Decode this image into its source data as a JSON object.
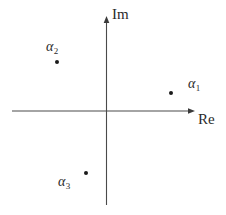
{
  "figure": {
    "type": "complex-plane-diagram",
    "background_color": "#ffffff",
    "line_color": "#4a4a4a",
    "text_color": "#2b2b2b",
    "dot_color": "#1a1a1a",
    "width": 226,
    "height": 215
  },
  "axes": {
    "real": {
      "label": "Re",
      "label_x": 198,
      "label_y": 112,
      "start_x": 12,
      "end_x": 195,
      "y": 111,
      "arrow": "right"
    },
    "imaginary": {
      "label": "Im",
      "label_x": 112,
      "label_y": 7,
      "x": 106,
      "start_y": 205,
      "end_y": 16,
      "arrow": "up"
    },
    "origin": {
      "x": 106,
      "y": 111
    }
  },
  "points": [
    {
      "name": "alpha-1",
      "symbol": "α",
      "subscript": "1",
      "dot_x": 171,
      "dot_y": 93,
      "label_x": 188,
      "label_y": 77,
      "quadrant": "I",
      "re": 0.73,
      "im": 0.18
    },
    {
      "name": "alpha-2",
      "symbol": "α",
      "subscript": "2",
      "dot_x": 57,
      "dot_y": 62,
      "label_x": 46,
      "label_y": 40,
      "quadrant": "II",
      "re": -0.52,
      "im": 0.52
    },
    {
      "name": "alpha-3",
      "symbol": "α",
      "subscript": "3",
      "dot_x": 86,
      "dot_y": 173,
      "label_x": 58,
      "label_y": 175,
      "quadrant": "III",
      "re": -0.21,
      "im": -0.66
    }
  ]
}
